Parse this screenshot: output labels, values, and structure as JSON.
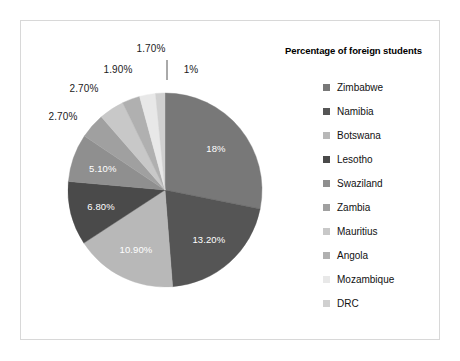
{
  "chart_data": {
    "type": "pie",
    "title": "Percentage of foreign students",
    "legend_position": "right",
    "units": "percent",
    "categories": [
      "Zimbabwe",
      "Namibia",
      "Botswana",
      "Lesotho",
      "Swaziland",
      "Zambia",
      "Mauritius",
      "Angola",
      "Mozambique",
      "DRC"
    ],
    "values": [
      18,
      13.2,
      10.9,
      6.8,
      5.1,
      2.7,
      2.7,
      1.9,
      1.7,
      1
    ],
    "labels": [
      "18%",
      "13.20%",
      "10.90%",
      "6.80%",
      "5.10%",
      "2.70%",
      "2.70%",
      "1.90%",
      "1.70%",
      "1%"
    ],
    "colors": [
      "#787878",
      "#555555",
      "#b8b8b8",
      "#4a4a4a",
      "#8f8f8f",
      "#a0a0a0",
      "#c8c8c8",
      "#b0b0b0",
      "#e8e8e8",
      "#d0d0d0"
    ],
    "slices": [
      {
        "name": "Zimbabwe",
        "value": 18,
        "label": "18%",
        "color": "#787878",
        "label_placement": "inside"
      },
      {
        "name": "Namibia",
        "value": 13.2,
        "label": "13.20%",
        "color": "#555555",
        "label_placement": "inside"
      },
      {
        "name": "Botswana",
        "value": 10.9,
        "label": "10.90%",
        "color": "#b8b8b8",
        "label_placement": "inside"
      },
      {
        "name": "Lesotho",
        "value": 6.8,
        "label": "6.80%",
        "color": "#4a4a4a",
        "label_placement": "inside"
      },
      {
        "name": "Swaziland",
        "value": 5.1,
        "label": "5.10%",
        "color": "#8f8f8f",
        "label_placement": "inside"
      },
      {
        "name": "Zambia",
        "value": 2.7,
        "label": "2.70%",
        "color": "#a0a0a0",
        "label_placement": "outside"
      },
      {
        "name": "Mauritius",
        "value": 2.7,
        "label": "2.70%",
        "color": "#c8c8c8",
        "label_placement": "outside"
      },
      {
        "name": "Angola",
        "value": 1.9,
        "label": "1.90%",
        "color": "#b0b0b0",
        "label_placement": "outside"
      },
      {
        "name": "Mozambique",
        "value": 1.7,
        "label": "1.70%",
        "color": "#e8e8e8",
        "label_placement": "outside"
      },
      {
        "name": "DRC",
        "value": 1,
        "label": "1%",
        "color": "#d0d0d0",
        "label_placement": "outside"
      }
    ]
  },
  "legend": {
    "title": "Percentage of foreign students",
    "items": [
      {
        "label": "Zimbabwe",
        "color": "#787878"
      },
      {
        "label": "Namibia",
        "color": "#555555"
      },
      {
        "label": "Botswana",
        "color": "#b8b8b8"
      },
      {
        "label": "Lesotho",
        "color": "#4a4a4a"
      },
      {
        "label": "Swaziland",
        "color": "#8f8f8f"
      },
      {
        "label": "Zambia",
        "color": "#a0a0a0"
      },
      {
        "label": "Mauritius",
        "color": "#c8c8c8"
      },
      {
        "label": "Angola",
        "color": "#b0b0b0"
      },
      {
        "label": "Mozambique",
        "color": "#e8e8e8"
      },
      {
        "label": "DRC",
        "color": "#d0d0d0"
      }
    ]
  },
  "geometry": {
    "center_x": 165,
    "center_y": 190,
    "radius": 97,
    "start_angle_deg": -90
  },
  "style": {
    "frame_border_color": "#d8d8d8",
    "background": "#ffffff",
    "inner_label_color": "#ffffff",
    "outer_label_color": "#1a1a1a"
  }
}
